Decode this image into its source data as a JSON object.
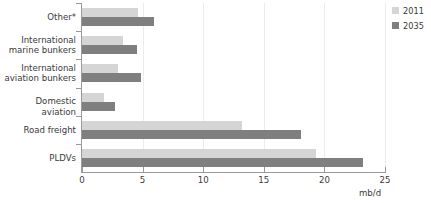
{
  "chart_data": {
    "type": "bar",
    "orientation": "horizontal",
    "title": "",
    "xlabel": "mb/d",
    "ylabel": "",
    "xlim": [
      0,
      25
    ],
    "xticks": [
      0,
      5,
      10,
      15,
      20,
      25
    ],
    "xtick_labels": [
      "0",
      "5",
      "10",
      "15",
      "20",
      "25"
    ],
    "grid": true,
    "legend_position": "top-right",
    "categories": [
      "Other*",
      "International\nmarine bunkers",
      "International\naviation bunkers",
      "Domestic aviation",
      "Road freight",
      "PLDVs"
    ],
    "series": [
      {
        "name": "2011",
        "color": "#d5d5d5",
        "values": [
          4.6,
          3.4,
          3.0,
          1.8,
          13.2,
          19.3
        ]
      },
      {
        "name": "2035",
        "color": "#7f7f7f",
        "values": [
          5.9,
          4.5,
          4.9,
          2.7,
          18.1,
          23.2
        ]
      }
    ]
  },
  "legend": {
    "items": [
      {
        "label": "2011",
        "color": "#d5d5d5"
      },
      {
        "label": "2035",
        "color": "#7f7f7f"
      }
    ]
  },
  "axis": {
    "x_title": "mb/d"
  }
}
